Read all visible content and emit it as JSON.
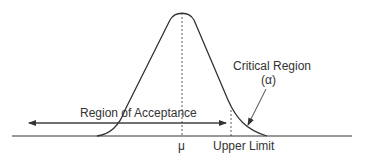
{
  "diagram": {
    "type": "normal-distribution-hypothesis-test",
    "labels": {
      "acceptance": "Region of Acceptance",
      "critical": "Critical Region",
      "alpha": "(α)",
      "mean": "μ",
      "upper_limit": "Upper Limit"
    },
    "colors": {
      "stroke": "#333333",
      "text": "#333333",
      "background": "#ffffff"
    }
  }
}
